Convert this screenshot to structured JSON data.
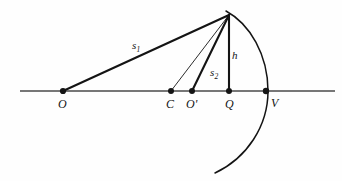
{
  "figure": {
    "background_color": "#fefefe",
    "stroke_color": "#141414",
    "axis_color": "#4a4a4a",
    "points": [
      {
        "id": "O",
        "label": "O",
        "x": 63,
        "y": 91
      },
      {
        "id": "C",
        "label": "C",
        "x": 171,
        "y": 91
      },
      {
        "id": "Op",
        "label": "O'",
        "x": 192,
        "y": 91
      },
      {
        "id": "Q",
        "label": "Q",
        "x": 229,
        "y": 91
      },
      {
        "id": "V",
        "label": "V",
        "x": 266,
        "y": 91
      },
      {
        "id": "P",
        "label": "",
        "x": 229,
        "y": 15
      }
    ],
    "segments": [
      {
        "id": "s1",
        "label": "s",
        "sub": "1",
        "from": "O",
        "to": "P",
        "label_x": 132,
        "label_y": 40,
        "width": 2.1
      },
      {
        "id": "s2",
        "label": "s",
        "sub": "2",
        "from": "Op",
        "to": "P",
        "label_x": 210,
        "label_y": 67,
        "width": 2.1
      },
      {
        "id": "h",
        "label": "h",
        "sub": "",
        "from": "Q",
        "to": "P",
        "label_x": 232,
        "label_y": 50,
        "width": 2.1
      },
      {
        "id": "r",
        "label": "",
        "sub": "",
        "from": "C",
        "to": "P",
        "label_x": 0,
        "label_y": 0,
        "width": 0.9
      }
    ],
    "axis": {
      "label": "optical-axis",
      "x1": 20,
      "y1": 91,
      "x2": 335,
      "y2": 91
    },
    "arc": {
      "label": "spherical-surface-arc",
      "path": "M 226 11 C 250 24 268 55 268 91 C 268 126 247 158 215 173"
    }
  }
}
